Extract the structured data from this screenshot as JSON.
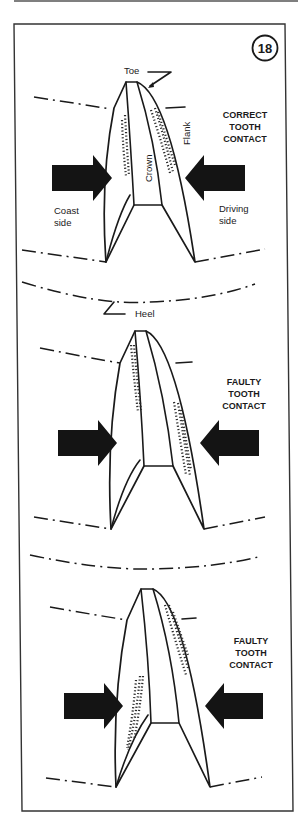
{
  "figure": {
    "number": "18",
    "panels": [
      {
        "caption": [
          "CORRECT",
          "TOOTH",
          "CONTACT"
        ],
        "labels": {
          "toe": "Toe",
          "crown": "Crown",
          "flank": "Flank",
          "coast_side": [
            "Coast",
            "side"
          ],
          "driving_side": [
            "Driving",
            "side"
          ]
        }
      },
      {
        "caption": [
          "FAULTY",
          "TOOTH",
          "CONTACT"
        ],
        "labels": {
          "heel": "Heel"
        }
      },
      {
        "caption": [
          "FAULTY",
          "TOOTH",
          "CONTACT"
        ]
      }
    ]
  },
  "colors": {
    "ink": "#1a1a1a",
    "paper": "#ffffff",
    "arrow": "#141414"
  }
}
